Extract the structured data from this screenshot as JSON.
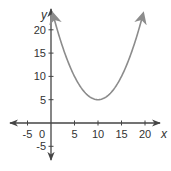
{
  "chart_data": {
    "type": "line",
    "title": "",
    "xlabel": "x",
    "ylabel": "y",
    "xlim": [
      -10,
      22
    ],
    "ylim": [
      -8,
      25
    ],
    "x_ticks": [
      -5,
      0,
      5,
      10,
      15,
      20
    ],
    "x_tick_labels": [
      "-5",
      "0",
      "5",
      "10",
      "15",
      "20"
    ],
    "y_ticks": [
      -5,
      5,
      10,
      15,
      20
    ],
    "y_tick_labels": [
      "-5",
      "5",
      "10",
      "15",
      "20"
    ],
    "origin_label": "0",
    "grid": false,
    "legend": "none",
    "series": [
      {
        "name": "parabola",
        "equation": "y = 0.2(x - 10)^2 + 5",
        "vertex": [
          10,
          5
        ],
        "x_range": [
          0.4,
          19.6
        ],
        "arrows_at_ends": true,
        "color": "#8c8c8c"
      }
    ],
    "axis_color": "#444444"
  }
}
